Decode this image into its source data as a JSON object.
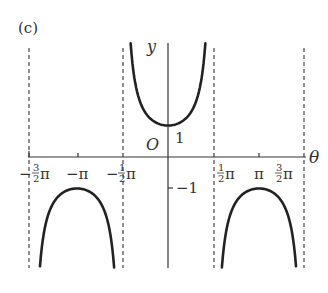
{
  "panel_label": "(c)",
  "axis": {
    "x_label": "θ",
    "y_label": "y",
    "origin_label": "O"
  },
  "tick_labels": {
    "neg_three_half_pi": {
      "sign": "−",
      "num": "3",
      "den": "2",
      "pi": "π"
    },
    "neg_pi": "−π",
    "neg_half_pi": {
      "sign": "−",
      "num": "1",
      "den": "2",
      "pi": "π"
    },
    "half_pi": {
      "num": "1",
      "den": "2",
      "pi": "π"
    },
    "pi": "π",
    "three_half_pi": {
      "num": "3",
      "den": "2",
      "pi": "π"
    },
    "y_one": "1",
    "y_neg_one": "−1"
  },
  "colors": {
    "curve": "#222222",
    "axis": "#333333",
    "asymptote": "#555555"
  },
  "chart_data": {
    "type": "line",
    "title": "(c)",
    "function": "y = sec θ",
    "xlabel": "θ",
    "ylabel": "y",
    "xlim": [
      -4.75,
      5.0
    ],
    "ylim": [
      -3.4,
      3.6
    ],
    "x_ticks": [
      "-3/2π",
      "-π",
      "-1/2π",
      "1/2π",
      "π",
      "3/2π"
    ],
    "y_ticks": [
      1,
      -1
    ],
    "asymptotes": [
      "θ = -3/2π",
      "θ = -1/2π",
      "θ = 1/2π",
      "θ = 3/2π"
    ],
    "series": [
      {
        "name": "branch around -π",
        "x_range": [
          -4.42,
          -1.86
        ],
        "min_max": {
          "θ": -3.1416,
          "y": -1
        }
      },
      {
        "name": "branch around 0",
        "x_range": [
          -1.29,
          1.29
        ],
        "min_max": {
          "θ": 0,
          "y": 1
        }
      },
      {
        "name": "branch around π",
        "x_range": [
          1.86,
          4.42
        ],
        "min_max": {
          "θ": 3.1416,
          "y": -1
        }
      }
    ],
    "grid": false,
    "legend": "none"
  }
}
